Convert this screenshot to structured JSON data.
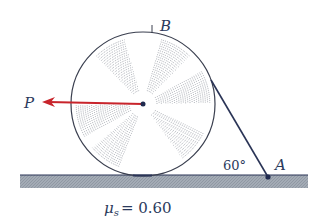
{
  "diagram": {
    "type": "statics-free-body-setup",
    "labels": {
      "force": "P",
      "top_point": "B",
      "anchor_point": "A",
      "angle": "60°",
      "friction_symbol": "μ",
      "friction_subscript": "s",
      "friction_value": "= 0.60"
    },
    "colors": {
      "force_arrow": "#c8242b",
      "outline": "#3a3f4f",
      "rope": "#2a3456",
      "ground_fill": "#9aa3ad",
      "ground_edge": "#2a3456",
      "hatch": "#8a8f98",
      "text": "#2b3a5c"
    },
    "geometry": {
      "cylinder_center": [
        143,
        104
      ],
      "cylinder_radius": 72,
      "rope_angle_deg": 60,
      "ground_y": 175
    }
  }
}
